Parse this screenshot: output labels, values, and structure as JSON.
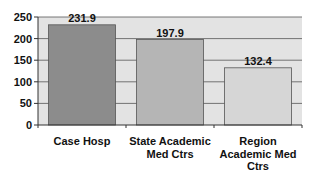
{
  "chart_data": {
    "type": "bar",
    "title": "",
    "xlabel": "",
    "ylabel": "",
    "categories": [
      [
        "Case Hosp"
      ],
      [
        "State Academic",
        "Med Ctrs"
      ],
      [
        "Region",
        "Academic Med",
        "Ctrs"
      ]
    ],
    "category_names": [
      "Case Hosp",
      "State Academic Med Ctrs",
      "Region Academic Med Ctrs"
    ],
    "values": [
      231.9,
      197.9,
      132.4
    ],
    "data_labels": [
      "231.9",
      "197.9",
      "132.4"
    ],
    "ylim": [
      0,
      250
    ],
    "yticks": [
      0,
      50,
      100,
      150,
      200,
      250
    ],
    "ytick_labels": [
      "0",
      "50",
      "100",
      "150",
      "200",
      "250"
    ],
    "grid": true,
    "legend": "none",
    "colors": {
      "plot_bg": "#e3e3e3",
      "bars": [
        "#8c8c8c",
        "#b5b5b5",
        "#d6d6d6"
      ],
      "bar_border": "#555555",
      "grid": "#555555",
      "axis": "#333333"
    }
  }
}
